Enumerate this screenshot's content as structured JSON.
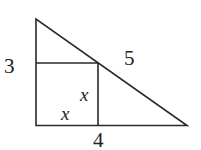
{
  "diagram": {
    "type": "geometry",
    "colors": {
      "stroke": "#2a2a2a",
      "text": "#222222",
      "background": "#ffffff"
    },
    "labels": {
      "left_leg": "3",
      "hypotenuse": "5",
      "bottom_leg": "4",
      "square_side_vertical": "x",
      "square_side_horizontal": "x"
    }
  }
}
